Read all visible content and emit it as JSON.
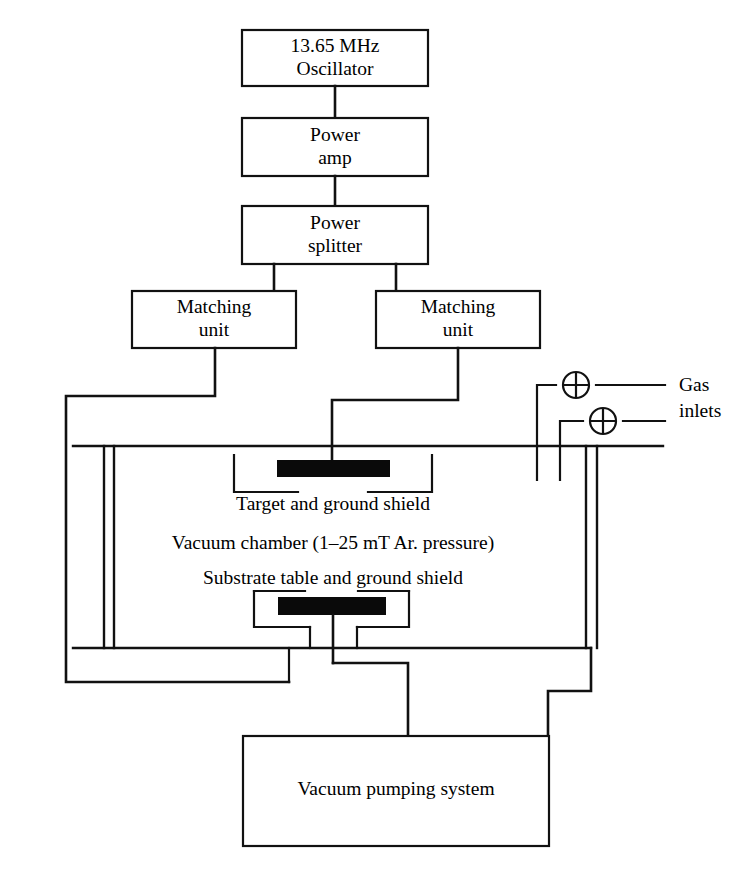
{
  "diagram": {
    "boxes": [
      {
        "id": "oscillator",
        "line1": "13.65 MHz",
        "line2": "Oscillator"
      },
      {
        "id": "power-amp",
        "line1": "Power",
        "line2": "amp"
      },
      {
        "id": "power-splitter",
        "line1": "Power",
        "line2": "splitter"
      },
      {
        "id": "matching-left",
        "line1": "Matching",
        "line2": "unit"
      },
      {
        "id": "matching-right",
        "line1": "Matching",
        "line2": "unit"
      },
      {
        "id": "vacuum-pump",
        "line1": "Vacuum pumping system",
        "line2": ""
      }
    ],
    "labels": {
      "target_shield": "Target and ground shield",
      "vacuum_chamber": "Vacuum chamber  (1–25 mT Ar. pressure)",
      "substrate_shield": "Substrate table and ground shield",
      "gas_inlets_line1": "Gas",
      "gas_inlets_line2": "inlets",
      "pump_system": "Vacuum pumping system"
    },
    "components": {
      "target_slab": "target-electrode",
      "substrate_slab": "substrate-table-electrode",
      "valve_upper": "gas-inlet-valve-upper",
      "valve_lower": "gas-inlet-valve-lower"
    },
    "colors": {
      "line": "#111111",
      "slab": "#0a0a0a",
      "background": "#ffffff",
      "text": "#000000"
    }
  }
}
